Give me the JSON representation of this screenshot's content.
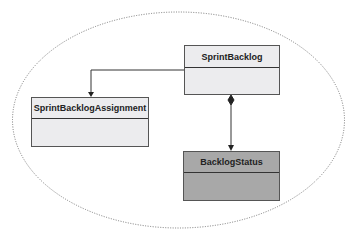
{
  "diagram": {
    "type": "uml-class-diagram",
    "boundary": {
      "shape": "ellipse",
      "style": "dotted"
    },
    "classes": [
      {
        "id": "sprint_backlog",
        "name": "SprintBacklog",
        "fill": "#ececee"
      },
      {
        "id": "sprint_backlog_assignment",
        "name": "SprintBacklogAssignment",
        "fill": "#ececee"
      },
      {
        "id": "backlog_status",
        "name": "BacklogStatus",
        "fill": "#a8a8a8"
      }
    ],
    "relationships": [
      {
        "from": "SprintBacklog",
        "to": "SprintBacklogAssignment",
        "kind": "directed-association"
      },
      {
        "from": "SprintBacklog",
        "to": "BacklogStatus",
        "kind": "composition"
      }
    ]
  }
}
